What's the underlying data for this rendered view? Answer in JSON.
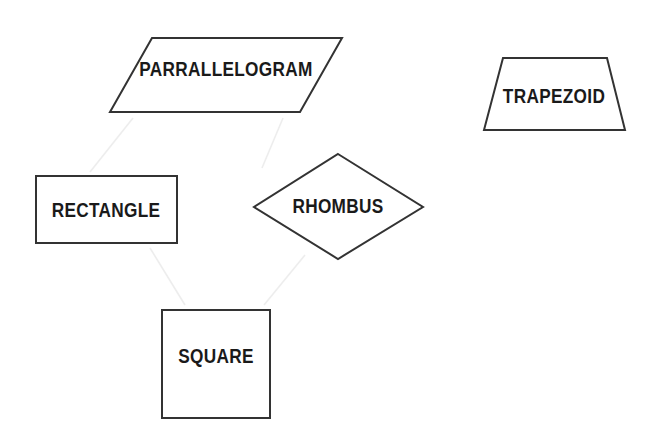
{
  "canvas": {
    "width": 658,
    "height": 438,
    "background": "#ffffff",
    "stroke_color": "#333333",
    "connector_color": "#ededed",
    "label_color": "#1a1a1a"
  },
  "shapes": [
    {
      "id": "parallelogram",
      "label": "PARRALLELOGRAM",
      "points": "152,38 342,38 300,112 110,112",
      "label_x": 226,
      "label_y": 70
    },
    {
      "id": "trapezoid",
      "label": "TRAPEZOID",
      "points": "503,58 607,58 625,130 484,130",
      "label_x": 554,
      "label_y": 97
    },
    {
      "id": "rectangle",
      "label": "RECTANGLE",
      "points": "36,176 177,176 177,243 36,243",
      "label_x": 106,
      "label_y": 211
    },
    {
      "id": "rhombus",
      "label": "RHOMBUS",
      "points": "338,154 423,207 338,259 254,207",
      "label_x": 338,
      "label_y": 207
    },
    {
      "id": "square",
      "label": "SQUARE",
      "points": "162,310 270,310 270,418 162,418",
      "label_x": 216,
      "label_y": 357
    }
  ],
  "connectors": [
    {
      "id": "parallelogram-to-rectangle",
      "x1": 133,
      "y1": 118,
      "x2": 90,
      "y2": 172
    },
    {
      "id": "parallelogram-to-rhombus",
      "x1": 283,
      "y1": 118,
      "x2": 262,
      "y2": 168
    },
    {
      "id": "rectangle-to-square",
      "x1": 150,
      "y1": 248,
      "x2": 185,
      "y2": 305
    },
    {
      "id": "rhombus-to-square",
      "x1": 305,
      "y1": 255,
      "x2": 264,
      "y2": 305
    }
  ]
}
